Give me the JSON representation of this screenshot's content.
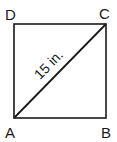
{
  "diagram": {
    "shape": "square",
    "vertices": [
      {
        "label": "D",
        "position": "top-left"
      },
      {
        "label": "C",
        "position": "top-right"
      },
      {
        "label": "A",
        "position": "bottom-left"
      },
      {
        "label": "B",
        "position": "bottom-right"
      }
    ],
    "diagonal": {
      "from": "A",
      "to": "C",
      "label": "15 in."
    },
    "stroke_color": "#1a1a1a"
  }
}
